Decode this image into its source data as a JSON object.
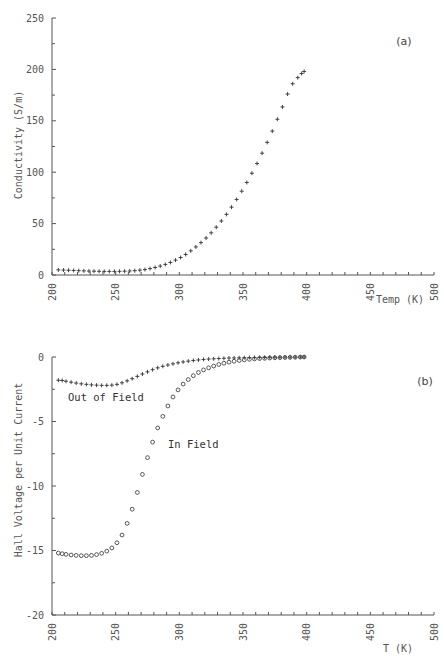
{
  "chart_data": [
    {
      "type": "scatter",
      "panel_label": "(a)",
      "title": "",
      "xlabel": "Temp (K)",
      "ylabel": "Conductivity (S/m)",
      "xlim": [
        200,
        500
      ],
      "ylim": [
        0,
        250
      ],
      "xticks": [
        "200",
        "250",
        "300",
        "350",
        "400",
        "450",
        "500"
      ],
      "yticks": [
        "0",
        "50",
        "100",
        "150",
        "200",
        "250"
      ],
      "grid": false,
      "series": [
        {
          "name": "Conductivity",
          "marker": "plus",
          "x": [
            205,
            209,
            213,
            217,
            221,
            225,
            229,
            233,
            237,
            241,
            245,
            249,
            253,
            257,
            261,
            265,
            269,
            273,
            277,
            281,
            285,
            289,
            293,
            297,
            301,
            305,
            309,
            313,
            317,
            321,
            325,
            329,
            333,
            337,
            341,
            345,
            349,
            353,
            357,
            361,
            365,
            369,
            373,
            377,
            381,
            385,
            389,
            393,
            396,
            398
          ],
          "y": [
            5,
            4.8,
            4.6,
            4.4,
            4.2,
            4,
            3.8,
            3.7,
            3.6,
            3.5,
            3.5,
            3.5,
            3.6,
            3.7,
            3.9,
            4.2,
            4.7,
            5.3,
            6.2,
            7.3,
            8.7,
            10.3,
            12.2,
            14.5,
            17,
            20,
            23.5,
            27.3,
            31.5,
            36,
            41,
            46.5,
            52.5,
            59,
            66,
            73.5,
            81.5,
            90,
            99,
            108.5,
            118.5,
            129,
            140,
            151.5,
            163.5,
            176,
            186,
            192,
            196,
            198
          ]
        }
      ]
    },
    {
      "type": "scatter",
      "panel_label": "(b)",
      "title": "",
      "xlabel": "T (K)",
      "ylabel": "Hall Voltage per Unit Current",
      "xlim": [
        200,
        500
      ],
      "ylim": [
        -20,
        0
      ],
      "xticks": [
        "200",
        "250",
        "300",
        "350",
        "400",
        "450",
        "500"
      ],
      "yticks": [
        "0",
        "-5",
        "-10",
        "-15",
        "-20"
      ],
      "grid": false,
      "annotations": [
        "Out of Field",
        "In Field"
      ],
      "series": [
        {
          "name": "Out of Field",
          "marker": "plus",
          "x": [
            205,
            208,
            211,
            215,
            219,
            223,
            227,
            231,
            235,
            239,
            243,
            247,
            251,
            255,
            259,
            263,
            267,
            271,
            275,
            279,
            283,
            287,
            291,
            295,
            299,
            303,
            307,
            311,
            315,
            319,
            323,
            327,
            331,
            335,
            339,
            343,
            347,
            351,
            355,
            359,
            363,
            367,
            371,
            375,
            379,
            383,
            387,
            391,
            395,
            398
          ],
          "y": [
            -1.8,
            -1.82,
            -1.88,
            -1.95,
            -2.02,
            -2.08,
            -2.12,
            -2.16,
            -2.18,
            -2.2,
            -2.2,
            -2.18,
            -2.12,
            -2.0,
            -1.85,
            -1.68,
            -1.5,
            -1.32,
            -1.15,
            -0.98,
            -0.84,
            -0.72,
            -0.62,
            -0.53,
            -0.45,
            -0.38,
            -0.32,
            -0.27,
            -0.23,
            -0.19,
            -0.16,
            -0.14,
            -0.12,
            -0.1,
            -0.08,
            -0.07,
            -0.06,
            -0.05,
            -0.04,
            -0.04,
            -0.03,
            -0.03,
            -0.02,
            -0.02,
            -0.02,
            -0.01,
            -0.01,
            -0.01,
            0,
            0
          ]
        },
        {
          "name": "In Field",
          "marker": "circle",
          "x": [
            205,
            208,
            211,
            215,
            219,
            223,
            227,
            231,
            235,
            239,
            243,
            247,
            251,
            255,
            259,
            263,
            267,
            271,
            275,
            279,
            283,
            287,
            291,
            295,
            299,
            303,
            307,
            311,
            315,
            319,
            323,
            327,
            331,
            335,
            339,
            343,
            347,
            351,
            355,
            359,
            363,
            367,
            371,
            375,
            379,
            383,
            387,
            391,
            395,
            398
          ],
          "y": [
            -15.2,
            -15.25,
            -15.3,
            -15.35,
            -15.38,
            -15.4,
            -15.4,
            -15.38,
            -15.32,
            -15.22,
            -15.05,
            -14.8,
            -14.4,
            -13.8,
            -12.9,
            -11.8,
            -10.5,
            -9.1,
            -7.8,
            -6.6,
            -5.5,
            -4.6,
            -3.8,
            -3.1,
            -2.55,
            -2.1,
            -1.75,
            -1.45,
            -1.2,
            -1.0,
            -0.84,
            -0.7,
            -0.58,
            -0.48,
            -0.4,
            -0.33,
            -0.27,
            -0.22,
            -0.18,
            -0.15,
            -0.12,
            -0.1,
            -0.08,
            -0.06,
            -0.05,
            -0.04,
            -0.03,
            -0.02,
            -0.01,
            0
          ]
        }
      ]
    }
  ],
  "colors": {
    "axis": "#555555",
    "marker": "#333333",
    "background": "#ffffff"
  }
}
